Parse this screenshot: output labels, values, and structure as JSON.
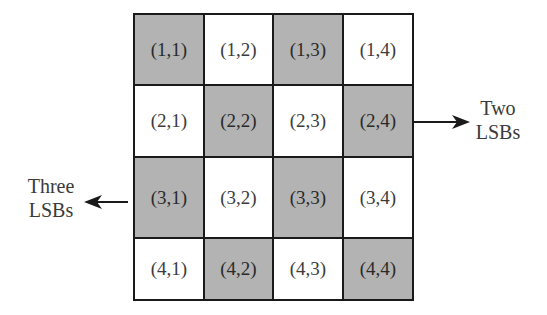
{
  "diagram": {
    "type": "grid-block-pattern",
    "rows": 4,
    "cols": 4,
    "colors": {
      "shaded": "#b3b3b3",
      "white": "#ffffff",
      "border": "#1a1a1a"
    },
    "cells": [
      [
        {
          "label": "(1,1)",
          "shade": "shaded"
        },
        {
          "label": "(1,2)",
          "shade": "white"
        },
        {
          "label": "(1,3)",
          "shade": "shaded"
        },
        {
          "label": "(1,4)",
          "shade": "white"
        }
      ],
      [
        {
          "label": "(2,1)",
          "shade": "white"
        },
        {
          "label": "(2,2)",
          "shade": "shaded"
        },
        {
          "label": "(2,3)",
          "shade": "white"
        },
        {
          "label": "(2,4)",
          "shade": "shaded"
        }
      ],
      [
        {
          "label": "(3,1)",
          "shade": "shaded"
        },
        {
          "label": "(3,2)",
          "shade": "white"
        },
        {
          "label": "(3,3)",
          "shade": "shaded"
        },
        {
          "label": "(3,4)",
          "shade": "white"
        }
      ],
      [
        {
          "label": "(4,1)",
          "shade": "white"
        },
        {
          "label": "(4,2)",
          "shade": "shaded"
        },
        {
          "label": "(4,3)",
          "shade": "white"
        },
        {
          "label": "(4,4)",
          "shade": "shaded"
        }
      ]
    ],
    "annotations": {
      "right": {
        "line1": "Two",
        "line2": "LSBs",
        "points_from": "(2,4)",
        "direction": "right"
      },
      "left": {
        "line1": "Three",
        "line2": "LSBs",
        "points_from": "(3,1)",
        "direction": "left"
      }
    }
  }
}
